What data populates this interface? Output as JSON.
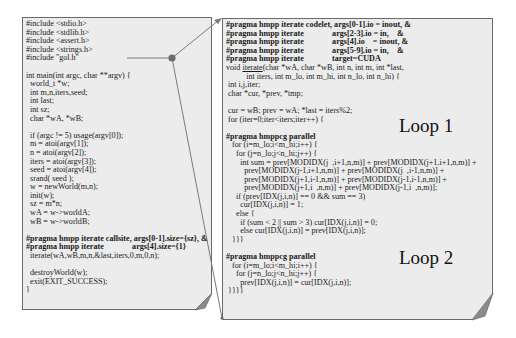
{
  "left_code": {
    "lines": [
      "#include <stdio.h>",
      "#include <stdlib.h>",
      "#include <assert.h>",
      "#include <strings.h>",
      "#include \"gol.h\"",
      "",
      "int main(int argc, char **argv) {",
      "  world_t *w;",
      "  int m,n,iters,seed;",
      "  int last;",
      "  int sz;",
      "  char *wA, *wB;",
      "",
      "  if (argc != 5) usage(argv[0]);",
      "  m = atoi(argv[1]);",
      "  n = atoi(argv[2]);",
      "  iters = atoi(argv[3]);",
      "  seed = atoi(argv[4]);",
      "  srand( seed );",
      "  w = newWorld(m,n);",
      "  init(w);",
      "  sz = m*n;",
      "  wA = w->worldA;",
      "  wB = w->worldB;",
      "",
      "#pragma hmpp iterate callsite, args[0-1].size={sz}, &",
      "#pragma hmpp iterate              args[4].size={1}",
      "  iterate(wA,wB,m,n,&last,iters,0,m,0,n);",
      "",
      "  destroyWorld(w);",
      "  exit(EXIT_SUCCESS);",
      "}"
    ]
  },
  "right_code": {
    "lines": [
      "#pragma hmpp iterate codelet, args[0-1].io = inout, &",
      "#pragma hmpp iterate              args[2-3].io = in,    &",
      "#pragma hmpp iterate              args[4].io    = inout, &",
      "#pragma hmpp iterate              args[5-9].io = in,    &",
      "#pragma hmpp iterate              target=CUDA",
      "void iterate(char *wA, char *wB, int n, int m, int *last,",
      "          int iters, int m_lo, int m_hi, int n_lo, int n_hi) {",
      " int i,j,iter;",
      " char *cur, *prev, *tmp;",
      "",
      " cur = wB; prev = wA; *last = iters%2;",
      " for (iter=0;iter<iters;iter++) {",
      "",
      "#pragma hmppcg parallel",
      "   for (i=m_lo;i<m_hi;i++) {",
      "     for (j=n_lo;j<n_hi;j++) {",
      "       int sum = prev[MODIDX(j  ,i+1,n,m)] + prev[MODIDX(j+1,i+1,n,m)] +",
      "         prev[MODIDX(j-1,i+1,n,m)] + prev[MODIDX(j  ,i-1,n,m)] +",
      "         prev[MODIDX(j+1,i-1,n,m)] + prev[MODIDX(j-1,i-1,n,m)] +",
      "         prev[MODIDX(j+1,i  ,n,m)] + prev[MODIDX(j-1,i  ,n,m)];",
      "     if (prev[IDX(j,i,n)] == 0 && sum == 3)",
      "       cur[IDX(j,i,n)] = 1;",
      "     else {",
      "       if (sum < 2 || sum > 3) cur[IDX(j,i,n)] = 0;",
      "       else cur[IDX(j,i,n)] = prev[IDX(j,i,n)];",
      "   }}}",
      "",
      "#pragma hmppcg parallel",
      "   for (i=m_lo;i<m_hi;i++) {",
      "     for (j=n_lo;j<n_hi;j++) {",
      "       prev[IDX(j,i,n)] = cur[IDX(j,i,n)];",
      " }}}}"
    ]
  },
  "labels": {
    "loop1": "Loop 1",
    "loop2": "Loop 2"
  },
  "colors": {
    "panel_bg": "#ececec",
    "panel_border": "#6a6a6a",
    "fold": "#8c8c8c",
    "connector": "#7a7a7a",
    "dot": "#6b6b6b"
  }
}
